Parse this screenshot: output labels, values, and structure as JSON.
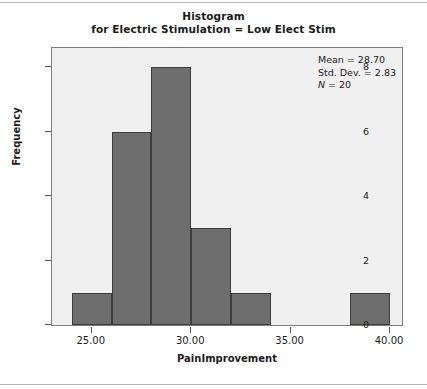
{
  "title": {
    "line1": "Histogram",
    "line2": "for Electric Stimulation = Low Elect Stim"
  },
  "stats": {
    "mean_label": "Mean = 28.70",
    "sd_label": "Std. Dev. = 2.83",
    "n_symbol": "N",
    "n_value": " = 20"
  },
  "colors": {
    "bar_fill": "#6e6e6e",
    "bar_edge": "#3d3d3d",
    "plot_background": "#f0f0f0",
    "frame": "#7b7b7b",
    "text": "#1b1b1b"
  },
  "chart_data": {
    "type": "bar",
    "title": "Histogram for Electric Stimulation = Low Elect Stim",
    "xlabel": "PainImprovement",
    "ylabel": "Frequency",
    "xlim": [
      23.0,
      40.6
    ],
    "ylim": [
      0,
      8.6
    ],
    "grid": false,
    "legend": "none",
    "bin_width": 2,
    "bins": [
      {
        "left": 24,
        "right": 26,
        "center": 25,
        "count": 1
      },
      {
        "left": 26,
        "right": 28,
        "center": 27,
        "count": 6
      },
      {
        "left": 28,
        "right": 30,
        "center": 29,
        "count": 8
      },
      {
        "left": 30,
        "right": 32,
        "center": 31,
        "count": 3
      },
      {
        "left": 32,
        "right": 34,
        "center": 33,
        "count": 1
      },
      {
        "left": 38,
        "right": 40,
        "center": 39,
        "count": 1
      }
    ],
    "categories": [
      "24-26",
      "26-28",
      "28-30",
      "30-32",
      "32-34",
      "38-40"
    ],
    "values": [
      1,
      6,
      8,
      3,
      1,
      1
    ],
    "x_ticks": [
      25,
      30,
      35,
      40
    ],
    "x_tick_labels": [
      "25.00",
      "30.00",
      "35.00",
      "40.00"
    ],
    "y_ticks": [
      0,
      2,
      4,
      6,
      8
    ],
    "y_tick_labels": [
      "0",
      "2",
      "4",
      "6",
      "8"
    ],
    "annotations": [
      "Mean = 28.70",
      "Std. Dev. = 2.83",
      "N = 20"
    ],
    "statistics": {
      "mean": 28.7,
      "std_dev": 2.83,
      "n": 20
    }
  }
}
